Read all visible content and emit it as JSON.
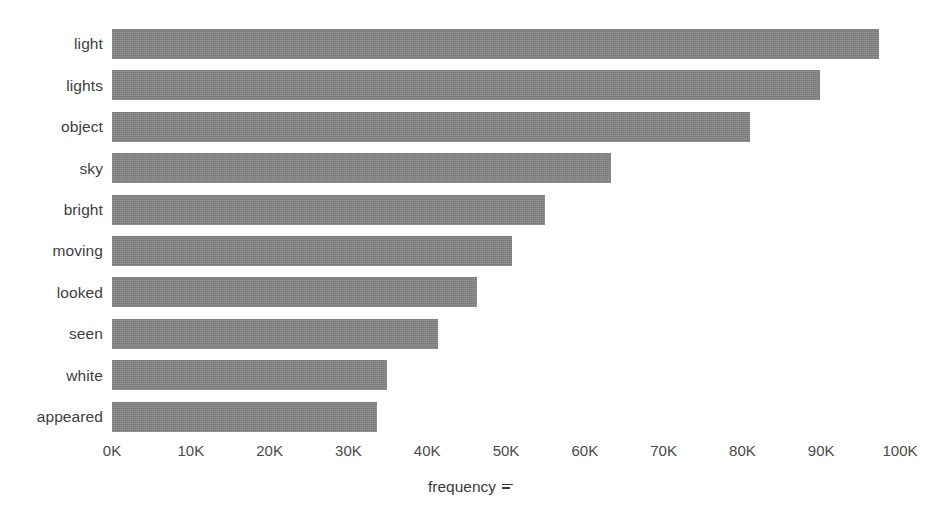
{
  "chart_data": {
    "type": "bar",
    "orientation": "horizontal",
    "title": "",
    "subtitle": "",
    "xlabel": "frequency",
    "ylabel": "",
    "categories": [
      "light",
      "lights",
      "object",
      "sky",
      "bright",
      "moving",
      "looked",
      "seen",
      "white",
      "appeared"
    ],
    "values": [
      97300,
      89800,
      81000,
      63300,
      54900,
      50700,
      46300,
      41400,
      34900,
      33600
    ],
    "value_labels": [
      "97.3K",
      "89.8K",
      "81.0K",
      "63.3K",
      "54.9K",
      "50.7K",
      "46.3K",
      "41.4K",
      "34.9K",
      "33.6K"
    ],
    "xlim": [
      0,
      100000
    ],
    "xticks": [
      0,
      10000,
      20000,
      30000,
      40000,
      50000,
      60000,
      70000,
      80000,
      90000,
      100000
    ],
    "xtick_labels": [
      "0K",
      "10K",
      "20K",
      "30K",
      "40K",
      "50K",
      "60K",
      "70K",
      "80K",
      "90K",
      "100K"
    ],
    "grid": false,
    "legend": null,
    "series": [
      {
        "name": "frequency",
        "values": [
          97300,
          89800,
          81000,
          63300,
          54900,
          50700,
          46300,
          41400,
          34900,
          33600
        ]
      }
    ]
  },
  "axis": {
    "x_label_text": "frequency",
    "x_label_icon": "sort-descending-icon"
  },
  "style": {
    "bar_color": "#848484",
    "background": "#ffffff",
    "text_color": "#3b3b3b",
    "tick_color": "#4a4a4a"
  }
}
